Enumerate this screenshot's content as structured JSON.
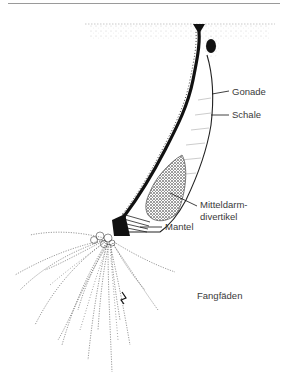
{
  "figure": {
    "labels": {
      "gonade": "Gonade",
      "schale": "Schale",
      "mitteldarm_line1": "Mitteldarm-",
      "mitteldarm_line2": "divertikel",
      "mantel": "Mantel",
      "fangfaeden": "Fangfäden"
    },
    "colors": {
      "ink": "#111111",
      "label_text": "#3a3a3a",
      "rule": "#9a9a9a",
      "background": "#ffffff"
    }
  }
}
